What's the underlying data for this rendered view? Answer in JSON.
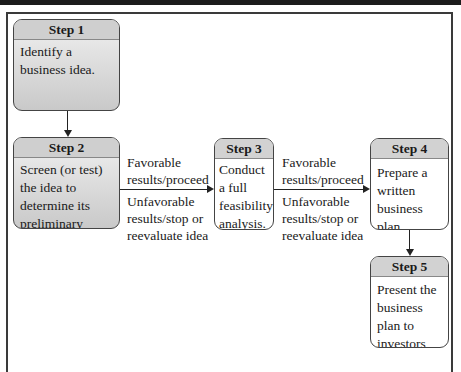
{
  "diagram": {
    "steps": [
      {
        "label": "Step 1",
        "text": "Identify a business idea.",
        "shaded": true
      },
      {
        "label": "Step 2",
        "text": "Screen (or test) the idea to determine its preliminary feasibility.",
        "shaded": true
      },
      {
        "label": "Step 3",
        "text": "Conduct a full feasibility analysis.",
        "shaded": false
      },
      {
        "label": "Step 4",
        "text": "Prepare a written business plan.",
        "shaded": false
      },
      {
        "label": "Step 5",
        "text": "Present the business plan to investors and others.",
        "shaded": false
      }
    ],
    "transitions": [
      {
        "from": "Step 1",
        "to": "Step 2",
        "favorable": "",
        "unfavorable": ""
      },
      {
        "from": "Step 2",
        "to": "Step 3",
        "favorable": "Favorable results/proceed",
        "unfavorable": "Unfavorable results/stop or reevaluate idea"
      },
      {
        "from": "Step 3",
        "to": "Step 4",
        "favorable": "Favorable results/proceed",
        "unfavorable": "Unfavorable results/stop or reevaluate idea"
      },
      {
        "from": "Step 4",
        "to": "Step 5",
        "favorable": "",
        "unfavorable": ""
      }
    ]
  },
  "colors": {
    "shaded_box": "#d0d0d0",
    "border": "#444444",
    "arrow": "#222222",
    "top_band": "#1c1c1c"
  }
}
